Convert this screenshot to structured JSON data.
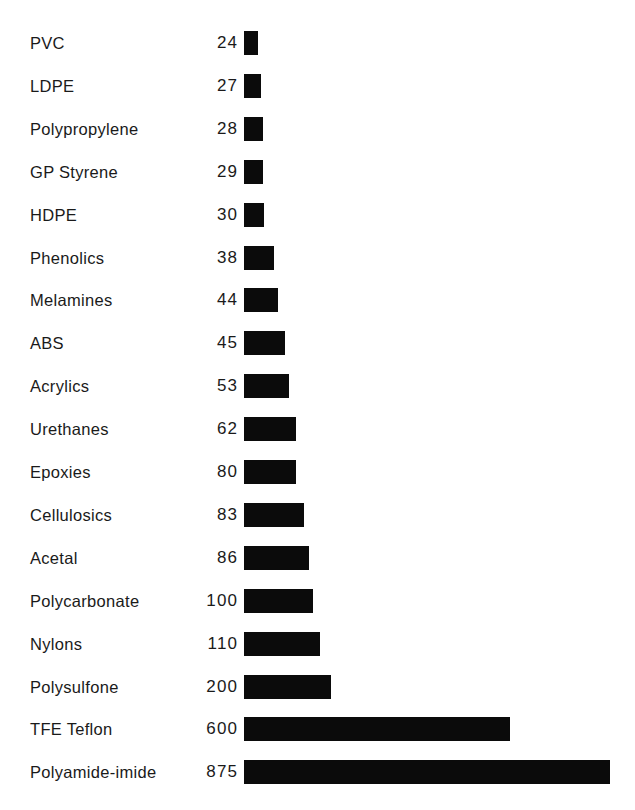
{
  "chart_data": {
    "type": "bar",
    "orientation": "horizontal",
    "title": "",
    "subtitle": "",
    "xlabel": "",
    "ylabel": "",
    "grid": false,
    "legend": null,
    "axis_visible": false,
    "value_label_position": "left-of-bar",
    "bar_color": "#0b0b0b",
    "background_color": "#ffffff",
    "note": "Scale is non-linear / compressed at the high end; bar pixel widths were read directly from the figure.",
    "categories": [
      "PVC",
      "LDPE",
      "Polypropylene",
      "GP Styrene",
      "HDPE",
      "Phenolics",
      "Melamines",
      "ABS",
      "Acrylics",
      "Urethanes",
      "Epoxies",
      "Cellulosics",
      "Acetal",
      "Polycarbonate",
      "Nylons",
      "Polysulfone",
      "TFE Teflon",
      "Polyamide-imide"
    ],
    "values": [
      24,
      27,
      28,
      29,
      30,
      38,
      44,
      45,
      53,
      62,
      80,
      83,
      86,
      100,
      110,
      200,
      600,
      875
    ],
    "value_labels": [
      "24",
      "27",
      "28",
      "29",
      "30",
      "38",
      "44",
      "45",
      "53",
      "62",
      "80",
      "83",
      "86",
      "100",
      "110",
      "200",
      "600",
      "875"
    ],
    "bar_pixel_widths": [
      14,
      17,
      19,
      19,
      20,
      30,
      34,
      41,
      45,
      52,
      52,
      60,
      65,
      69,
      76,
      87,
      266,
      366
    ],
    "ylim": [
      0,
      875
    ]
  },
  "layout": {
    "row_top_start": 31,
    "row_spacing": 42.9,
    "bar_height": 24,
    "bar_origin_x": 244
  }
}
